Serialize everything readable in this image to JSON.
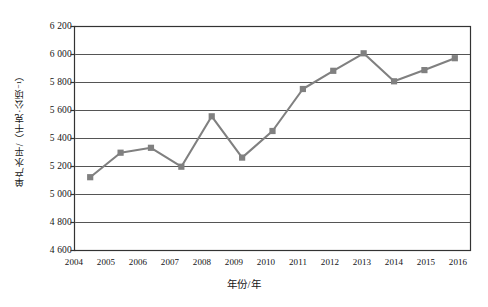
{
  "chart_data": {
    "type": "line",
    "title": "",
    "xlabel": "年份/年",
    "ylabel": "单产水平/（千克·公顷⁻¹）",
    "categories": [
      "2004",
      "2005",
      "2006",
      "2007",
      "2008",
      "2009",
      "2010",
      "2011",
      "2012",
      "2013",
      "2014",
      "2015",
      "2016"
    ],
    "values": [
      5120,
      5295,
      5330,
      5195,
      5555,
      5260,
      5450,
      5750,
      5880,
      6005,
      5805,
      5885,
      5970
    ],
    "series": [
      {
        "name": "单产水平",
        "values": [
          5120,
          5295,
          5330,
          5195,
          5555,
          5260,
          5450,
          5750,
          5880,
          6005,
          5805,
          5885,
          5970
        ]
      }
    ],
    "ylim": [
      4600,
      6200
    ],
    "ytick_labels": [
      "6 200",
      "6 000",
      "5 800",
      "5 600",
      "5 400",
      "5 200",
      "5 000",
      "4 800",
      "4 600"
    ],
    "ytick_values": [
      6200,
      6000,
      5800,
      5600,
      5400,
      5200,
      5000,
      4800,
      4600
    ],
    "xtick_labels": [
      "2004",
      "2005",
      "2006",
      "2007",
      "2008",
      "2009",
      "2010",
      "2011",
      "2012",
      "2013",
      "2014",
      "2015",
      "2016"
    ],
    "grid": true,
    "grid_axis": "y",
    "legend": false,
    "legend_position": "none",
    "marker": "square",
    "line_color": "#808080",
    "marker_color": "#808080",
    "grid_color": "#555555",
    "frame_color": "#333333",
    "background_color": "#ffffff"
  }
}
